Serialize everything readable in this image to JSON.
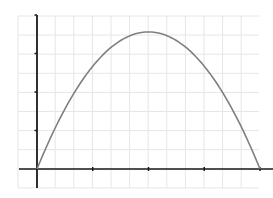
{
  "chart_data": {
    "type": "line",
    "title": "",
    "xlabel": "",
    "ylabel": "",
    "xlim": [
      -0.33,
      4.3
    ],
    "ylim": [
      -0.5,
      4.0
    ],
    "x_ticks": [
      0,
      1,
      2,
      3,
      4
    ],
    "y_ticks": [
      0,
      1,
      2,
      3,
      4
    ],
    "tick_labels_shown": false,
    "grid": true,
    "legend": null,
    "series": [
      {
        "name": "parabola",
        "color": "#7f7f7f",
        "x": [
          0,
          0.25,
          0.5,
          0.75,
          1,
          1.25,
          1.5,
          1.75,
          2,
          2.25,
          2.5,
          2.75,
          3,
          3.25,
          3.5,
          3.75,
          4
        ],
        "y": [
          0,
          0.83,
          1.56,
          2.18,
          2.67,
          3.06,
          3.33,
          3.5,
          3.56,
          3.5,
          3.33,
          3.06,
          2.67,
          2.18,
          1.56,
          0.83,
          0
        ]
      }
    ],
    "colors": {
      "grid": "#e6e6e6",
      "axis": "#1a1a1a",
      "curve": "#7f7f7f",
      "background": "#ffffff"
    }
  }
}
